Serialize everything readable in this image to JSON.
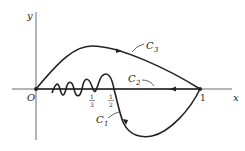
{
  "diagram": {
    "axes": {
      "x_label": "x",
      "y_label": "y",
      "origin_label": "O",
      "one_label": "1"
    },
    "ticks": {
      "third_num": "1",
      "third_den": "3",
      "half_num": "1",
      "half_den": "2"
    },
    "curves": [
      {
        "name": "C",
        "sub": "3",
        "description": "arc above x-axis from O to 1"
      },
      {
        "name": "C",
        "sub": "2",
        "description": "segment along x-axis from 1 back to O"
      },
      {
        "name": "C",
        "sub": "1",
        "description": "oscillating curve from O through 1/3, 1/2, dipping below axis to 1"
      }
    ],
    "colors": {
      "stroke": "#222222",
      "background": "#ffffff"
    }
  }
}
